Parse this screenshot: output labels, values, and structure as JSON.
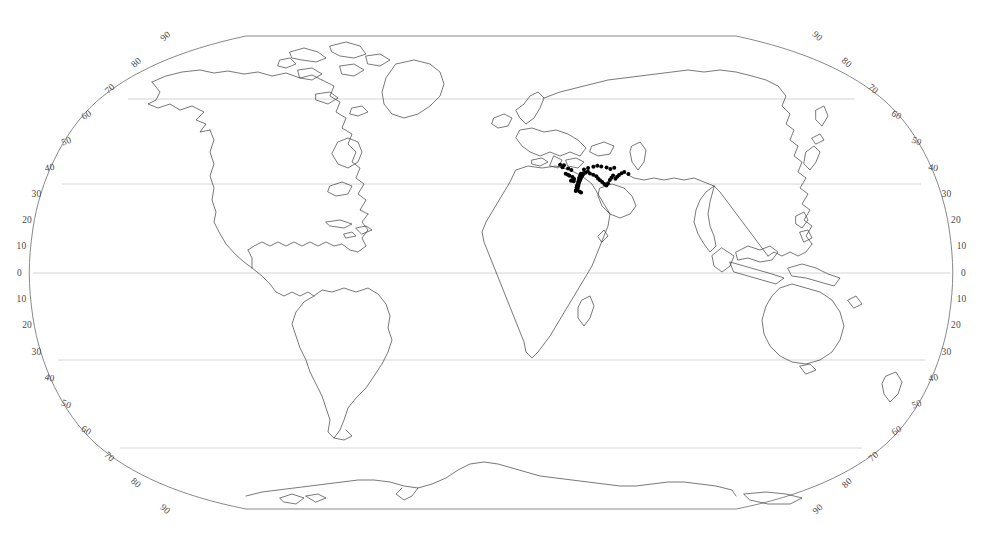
{
  "map": {
    "title": "World Distribution Map",
    "projection": "pseudocylindrical",
    "background_color": "#ffffff",
    "coastline_color": "#3a3a3a",
    "graticule_color": "#cfcfcf",
    "frame_color": "#6f6f6f",
    "point_color": "#000000",
    "label_color": "#4a4a4a"
  },
  "graticule": {
    "latitude_gridlines": [
      60,
      30,
      0,
      -30,
      -60
    ],
    "gridline_label_values": [
      90,
      80,
      70,
      60,
      50,
      40,
      30,
      20,
      10,
      0
    ],
    "gridlines_visible": true,
    "longitude_gridlines_visible": false
  },
  "labels": {
    "left": [
      {
        "text": "90",
        "lat": 90
      },
      {
        "text": "80",
        "lat": 80
      },
      {
        "text": "70",
        "lat": 70
      },
      {
        "text": "60",
        "lat": 60
      },
      {
        "text": "50",
        "lat": 50
      },
      {
        "text": "40",
        "lat": 40
      },
      {
        "text": "30",
        "lat": 30
      },
      {
        "text": "20",
        "lat": 20
      },
      {
        "text": "10",
        "lat": 10
      },
      {
        "text": "0",
        "lat": 0
      },
      {
        "text": "10",
        "lat": -10
      },
      {
        "text": "20",
        "lat": -20
      },
      {
        "text": "30",
        "lat": -30
      },
      {
        "text": "40",
        "lat": -40
      },
      {
        "text": "50",
        "lat": -50
      },
      {
        "text": "60",
        "lat": -60
      },
      {
        "text": "70",
        "lat": -70
      },
      {
        "text": "80",
        "lat": -80
      },
      {
        "text": "90",
        "lat": -90
      }
    ],
    "right": [
      {
        "text": "90",
        "lat": 90
      },
      {
        "text": "80",
        "lat": 80
      },
      {
        "text": "70",
        "lat": 70
      },
      {
        "text": "60",
        "lat": 60
      },
      {
        "text": "50",
        "lat": 50
      },
      {
        "text": "40",
        "lat": 40
      },
      {
        "text": "30",
        "lat": 30
      },
      {
        "text": "20",
        "lat": 20
      },
      {
        "text": "10",
        "lat": 10
      },
      {
        "text": "0",
        "lat": 0
      },
      {
        "text": "10",
        "lat": -10
      },
      {
        "text": "20",
        "lat": -20
      },
      {
        "text": "30",
        "lat": -30
      },
      {
        "text": "40",
        "lat": -40
      },
      {
        "text": "50",
        "lat": -50
      },
      {
        "text": "60",
        "lat": -60
      },
      {
        "text": "70",
        "lat": -70
      },
      {
        "text": "80",
        "lat": -80
      },
      {
        "text": "90",
        "lat": -90
      }
    ]
  },
  "chart_data": {
    "type": "scatter",
    "xlabel": "",
    "ylabel": "",
    "xlim": [
      -180,
      180
    ],
    "ylim": [
      -90,
      90
    ],
    "grid": true,
    "legend": "none",
    "series": [
      {
        "name": "occurrence-points",
        "color": "#000000",
        "description": "Dense cluster of occurrence records concentrated in the Eastern Mediterranean / Levant / Anatolia region, with scattered outliers eastward toward the Caspian and Central Asia.",
        "points": [
          [
            34.8,
            31.6
          ],
          [
            35.0,
            31.9
          ],
          [
            35.2,
            32.1
          ],
          [
            34.9,
            32.3
          ],
          [
            35.3,
            32.5
          ],
          [
            35.5,
            32.8
          ],
          [
            35.1,
            33.0
          ],
          [
            35.6,
            33.2
          ],
          [
            35.4,
            33.5
          ],
          [
            35.8,
            33.8
          ],
          [
            36.0,
            34.1
          ],
          [
            35.7,
            34.4
          ],
          [
            36.2,
            34.6
          ],
          [
            36.4,
            34.9
          ],
          [
            36.1,
            35.2
          ],
          [
            36.6,
            35.4
          ],
          [
            36.9,
            35.7
          ],
          [
            36.3,
            36.0
          ],
          [
            37.1,
            36.2
          ],
          [
            37.4,
            36.5
          ],
          [
            36.8,
            36.8
          ],
          [
            37.7,
            37.0
          ],
          [
            38.0,
            37.3
          ],
          [
            37.2,
            37.6
          ],
          [
            38.3,
            37.8
          ],
          [
            34.6,
            31.3
          ],
          [
            34.4,
            31.0
          ],
          [
            35.9,
            30.8
          ],
          [
            36.5,
            30.4
          ],
          [
            33.9,
            34.7
          ],
          [
            33.3,
            35.1
          ],
          [
            32.8,
            34.9
          ],
          [
            34.2,
            35.6
          ],
          [
            33.6,
            36.3
          ],
          [
            32.4,
            36.8
          ],
          [
            31.8,
            37.2
          ],
          [
            30.9,
            37.6
          ],
          [
            39.1,
            38.0
          ],
          [
            40.2,
            38.4
          ],
          [
            41.0,
            37.7
          ],
          [
            42.3,
            37.2
          ],
          [
            43.5,
            36.6
          ],
          [
            44.1,
            35.8
          ],
          [
            44.8,
            35.1
          ],
          [
            45.6,
            34.4
          ],
          [
            46.4,
            33.7
          ],
          [
            47.2,
            33.1
          ],
          [
            48.0,
            34.0
          ],
          [
            48.9,
            35.2
          ],
          [
            49.7,
            36.1
          ],
          [
            50.5,
            36.9
          ],
          [
            51.3,
            35.7
          ],
          [
            52.1,
            36.4
          ],
          [
            53.0,
            37.1
          ],
          [
            54.2,
            37.8
          ],
          [
            29.8,
            40.1
          ],
          [
            30.5,
            40.8
          ],
          [
            28.9,
            41.0
          ],
          [
            32.1,
            39.6
          ],
          [
            33.4,
            39.0
          ],
          [
            38.7,
            39.2
          ],
          [
            40.5,
            39.8
          ],
          [
            42.8,
            40.2
          ],
          [
            44.5,
            40.6
          ],
          [
            46.1,
            40.3
          ],
          [
            48.3,
            40.0
          ],
          [
            49.8,
            39.4
          ],
          [
            51.5,
            39.9
          ],
          [
            55.4,
            38.2
          ],
          [
            57.0,
            37.5
          ]
        ]
      }
    ]
  }
}
